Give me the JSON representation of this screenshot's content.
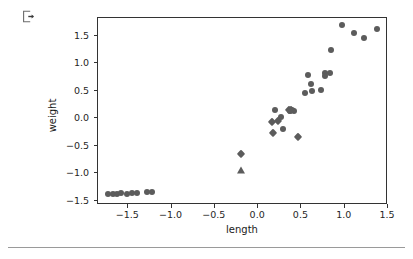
{
  "toolbar": {
    "export_icon": "export-icon"
  },
  "chart_data": {
    "type": "scatter",
    "title": "",
    "xlabel": "length",
    "ylabel": "weight",
    "xlim": [
      -1.85,
      1.5
    ],
    "ylim": [
      -1.58,
      1.82
    ],
    "grid": false,
    "legend": "none",
    "xticks": [
      "-1.5",
      "-1.0",
      "-0.5",
      "0.0",
      "0.5",
      "1.0",
      "1.5"
    ],
    "xtickvalues": [
      -1.5,
      -1.0,
      -0.5,
      0.0,
      0.5,
      1.0,
      1.5
    ],
    "yticks": [
      "1.5",
      "1.0",
      "0.5",
      "0.0",
      "-0.5",
      "-1.0",
      "-1.5"
    ],
    "ytickvalues": [
      1.5,
      1.0,
      0.5,
      0.0,
      -0.5,
      -1.0,
      -1.5
    ],
    "marker_color": "#5c5c5c",
    "series": [
      {
        "name": "circles",
        "marker": "circle",
        "color": "#5c5c5c",
        "points": [
          [
            -1.73,
            -1.385
          ],
          [
            -1.68,
            -1.38
          ],
          [
            -1.63,
            -1.375
          ],
          [
            -1.58,
            -1.37
          ],
          [
            -1.52,
            -1.375
          ],
          [
            -1.46,
            -1.37
          ],
          [
            -1.4,
            -1.37
          ],
          [
            -1.28,
            -1.345
          ],
          [
            -1.23,
            -1.345
          ],
          [
            0.2,
            0.155
          ],
          [
            0.26,
            0.015
          ],
          [
            0.29,
            -0.195
          ],
          [
            0.365,
            0.135
          ],
          [
            0.39,
            0.145
          ],
          [
            0.41,
            0.135
          ],
          [
            0.545,
            0.455
          ],
          [
            0.575,
            0.775
          ],
          [
            0.605,
            0.625
          ],
          [
            0.625,
            0.495
          ],
          [
            0.73,
            0.52
          ],
          [
            0.775,
            0.815
          ],
          [
            0.775,
            0.765
          ],
          [
            0.835,
            0.815
          ],
          [
            0.845,
            1.235
          ],
          [
            0.965,
            1.7
          ],
          [
            1.105,
            1.555
          ],
          [
            1.22,
            1.465
          ],
          [
            1.37,
            1.615
          ]
        ]
      },
      {
        "name": "diamonds",
        "marker": "diamond",
        "color": "#5c5c5c",
        "points": [
          [
            -0.195,
            -0.645
          ],
          [
            0.165,
            -0.07
          ],
          [
            0.175,
            -0.275
          ],
          [
            0.235,
            -0.055
          ],
          [
            0.355,
            0.14
          ],
          [
            0.38,
            0.15
          ],
          [
            0.465,
            -0.345
          ]
        ]
      },
      {
        "name": "triangles",
        "marker": "triangle",
        "color": "#5c5c5c",
        "points": [
          [
            -0.2,
            -0.945
          ]
        ]
      }
    ]
  }
}
